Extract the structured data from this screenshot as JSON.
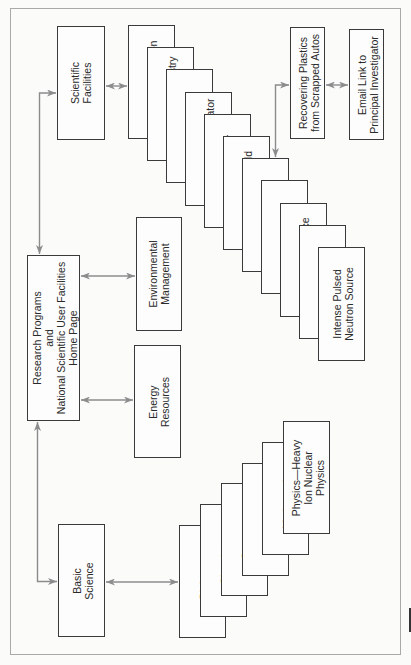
{
  "diagram": {
    "root": {
      "label": "Research Programs\nand\nNational Scientific User Facilities\nHome Page"
    },
    "categories": {
      "scientific_facilities": "Scientific\nFacilities",
      "environmental_management": "Environmental\nManagement",
      "energy_resources": "Energy\nResources",
      "basic_science": "Basic\nScience"
    },
    "facilities": [
      "Advanced Photon",
      "Analytical Chemistry",
      "Guest House",
      "Wakefield Accelerator",
      "Tandem–Linear",
      "Atmospheric Field",
      "Auto Shredder",
      "Basic Energy",
      "High-Performance",
      "High-Voltage",
      "Intense Pulsed\nNeutron Source"
    ],
    "basic_science_topics": [
      "Biology",
      "Chemistry",
      "Sensors",
      "Materials",
      "Mathematics",
      "Physics—Heavy\nIon Nuclear\nPhysics"
    ],
    "auto_shredder_links": {
      "recovering_plastics": "Recovering Plastics\nfrom Scrapped Autos",
      "email_link": "Email Link to\nPrincipal Investigator"
    },
    "colors": {
      "box_border": "#3a3a3a",
      "arrow": "#8c8c8c",
      "frame": "#a9a9a9",
      "text": "#2a2a2a",
      "background": "#fbfbfa"
    }
  }
}
